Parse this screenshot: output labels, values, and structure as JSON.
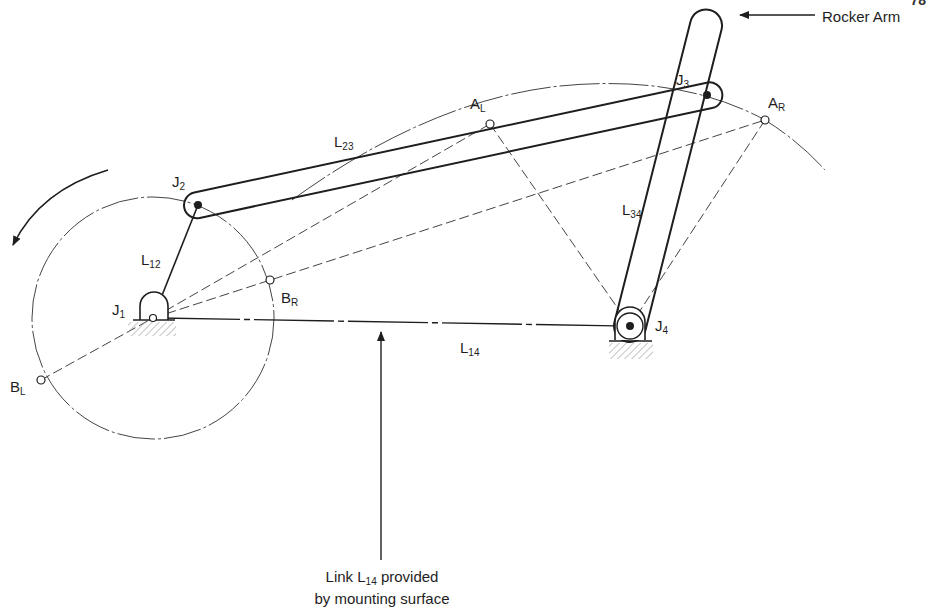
{
  "figure": {
    "type": "four-bar linkage (crank-rocker) schematic",
    "corner_text": "78"
  },
  "joints": {
    "J1": {
      "label": "J",
      "sub": "1"
    },
    "J2": {
      "label": "J",
      "sub": "2"
    },
    "J3": {
      "label": "J",
      "sub": "3"
    },
    "J4": {
      "label": "J",
      "sub": "4"
    }
  },
  "links": {
    "L12": {
      "label": "L",
      "sub": "12"
    },
    "L23": {
      "label": "L",
      "sub": "23"
    },
    "L34": {
      "label": "L",
      "sub": "34"
    },
    "L14": {
      "label": "L",
      "sub": "14"
    }
  },
  "points": {
    "AL": {
      "label": "A",
      "sub": "L"
    },
    "AR": {
      "label": "A",
      "sub": "R"
    },
    "BL": {
      "label": "B",
      "sub": "L"
    },
    "BR": {
      "label": "B",
      "sub": "R"
    }
  },
  "annotations": {
    "rocker_arm": "Rocker Arm",
    "mounting_line1_pre": "Link L",
    "mounting_line1_sub": "14",
    "mounting_line1_post": " provided",
    "mounting_line2": "by mounting surface"
  },
  "colors": {
    "ink": "#1e1e1e",
    "construction": "#444444",
    "hatch": "#9a9a9a",
    "background": "#ffffff"
  }
}
